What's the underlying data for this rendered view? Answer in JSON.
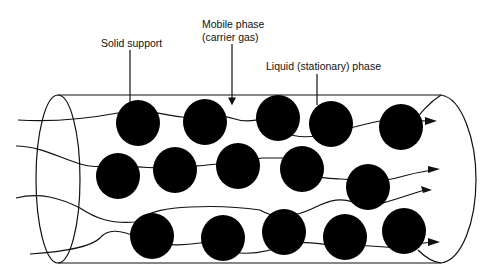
{
  "labels": {
    "solid_support": "Solid support",
    "mobile_phase_line1": "Mobile phase",
    "mobile_phase_line2": "(carrier gas)",
    "liquid_phase": "Liquid (stationary) phase"
  },
  "colors": {
    "particle": "#000000",
    "line": "#111111",
    "background": "#ffffff"
  },
  "particles": [
    {
      "x": 138,
      "y": 123
    },
    {
      "x": 205,
      "y": 122
    },
    {
      "x": 278,
      "y": 118
    },
    {
      "x": 331,
      "y": 124
    },
    {
      "x": 401,
      "y": 127
    },
    {
      "x": 118,
      "y": 176
    },
    {
      "x": 175,
      "y": 170
    },
    {
      "x": 238,
      "y": 166
    },
    {
      "x": 302,
      "y": 169
    },
    {
      "x": 368,
      "y": 187
    },
    {
      "x": 152,
      "y": 236
    },
    {
      "x": 223,
      "y": 238
    },
    {
      "x": 284,
      "y": 232
    },
    {
      "x": 345,
      "y": 237
    },
    {
      "x": 404,
      "y": 231
    }
  ]
}
